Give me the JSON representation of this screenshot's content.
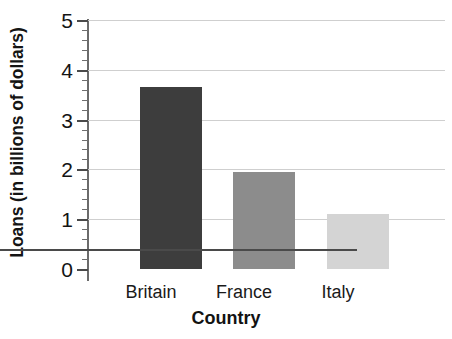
{
  "chart_data": {
    "type": "bar",
    "title": "",
    "subtitle": "",
    "xlabel": "Country",
    "ylabel": "Loans (in billions of dollars)",
    "categories": [
      "Britain",
      "France",
      "Italy"
    ],
    "values": [
      3.65,
      1.95,
      1.1
    ],
    "series": [
      {
        "name": "Loans",
        "values": [
          3.65,
          1.95,
          1.1
        ]
      }
    ],
    "ylim": [
      0,
      5
    ],
    "ytick_labels": [
      "5",
      "4",
      "3",
      "2",
      "1",
      "0"
    ],
    "ytick_values": [
      5,
      4,
      3,
      2,
      1,
      0
    ],
    "minor_tick_interval": 0.2,
    "grid": "horizontal",
    "legend": "none",
    "bar_colors": [
      "#3d3d3d",
      "#8c8c8c",
      "#d4d4d4"
    ],
    "gridline_color": "#cfcfcf",
    "axis_color": "#4a4a4a",
    "background_color": "#ffffff"
  }
}
